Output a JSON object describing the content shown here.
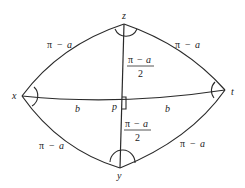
{
  "diagram": {
    "vertices": {
      "z": {
        "label": "z"
      },
      "x": {
        "label": "x"
      },
      "t": {
        "label": "t"
      },
      "y": {
        "label": "y"
      },
      "p": {
        "label": "p"
      }
    },
    "edge_labels": {
      "zx": {
        "pi": "π",
        "minus": "−",
        "var": "a"
      },
      "zt": {
        "pi": "π",
        "minus": "−",
        "var": "a"
      },
      "xy": {
        "pi": "π",
        "minus": "−",
        "var": "a"
      },
      "ty": {
        "pi": "π",
        "minus": "−",
        "var": "a"
      },
      "xp": {
        "var": "b"
      },
      "pt": {
        "var": "b"
      }
    },
    "fraction_labels": {
      "zp": {
        "pi": "π",
        "minus": "−",
        "var": "a",
        "denominator": "2"
      },
      "py": {
        "pi": "π",
        "minus": "−",
        "var": "a",
        "denominator": "2"
      }
    }
  }
}
